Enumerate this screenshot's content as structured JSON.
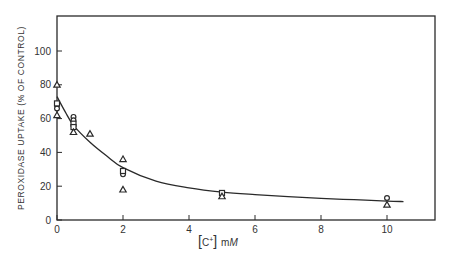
{
  "chart_data": {
    "type": "scatter",
    "title": "",
    "xlabel": "[C+] mM",
    "xlabel_parts": {
      "bracket_open": "[",
      "species": "C",
      "charge": "+",
      "bracket_close": "]",
      "unit_prefix": "m",
      "unit": "M"
    },
    "ylabel": "PEROXIDASE UPTAKE (% OF CONTROL)",
    "xlim": [
      0,
      11.5
    ],
    "ylim": [
      0,
      120
    ],
    "x_ticks": [
      0,
      2,
      4,
      6,
      8,
      10
    ],
    "y_ticks": [
      0,
      20,
      40,
      60,
      80,
      100
    ],
    "grid": false,
    "legend": null,
    "series": [
      {
        "name": "circles",
        "marker": "circle",
        "points": [
          [
            0,
            68
          ],
          [
            0,
            66
          ],
          [
            0.5,
            61
          ],
          [
            0.5,
            59
          ],
          [
            2,
            27
          ],
          [
            10,
            13
          ]
        ]
      },
      {
        "name": "squares",
        "marker": "square",
        "points": [
          [
            0,
            69
          ],
          [
            0.5,
            57
          ],
          [
            0.5,
            55
          ],
          [
            2,
            29
          ],
          [
            5,
            16
          ]
        ]
      },
      {
        "name": "triangles",
        "marker": "triangle",
        "points": [
          [
            0,
            80
          ],
          [
            0,
            62
          ],
          [
            0.5,
            52
          ],
          [
            1,
            51
          ],
          [
            2,
            36
          ],
          [
            2,
            18
          ],
          [
            5,
            14
          ],
          [
            10,
            9
          ]
        ]
      },
      {
        "name": "fit",
        "marker": "line",
        "points": [
          [
            0,
            73
          ],
          [
            0.25,
            64
          ],
          [
            0.5,
            56
          ],
          [
            1,
            46
          ],
          [
            1.5,
            38
          ],
          [
            2,
            31
          ],
          [
            3,
            23
          ],
          [
            4,
            19
          ],
          [
            5,
            16.5
          ],
          [
            6,
            15
          ],
          [
            7,
            13.8
          ],
          [
            8,
            12.8
          ],
          [
            9,
            12
          ],
          [
            10,
            11.2
          ],
          [
            10.5,
            10.9
          ]
        ]
      }
    ]
  }
}
